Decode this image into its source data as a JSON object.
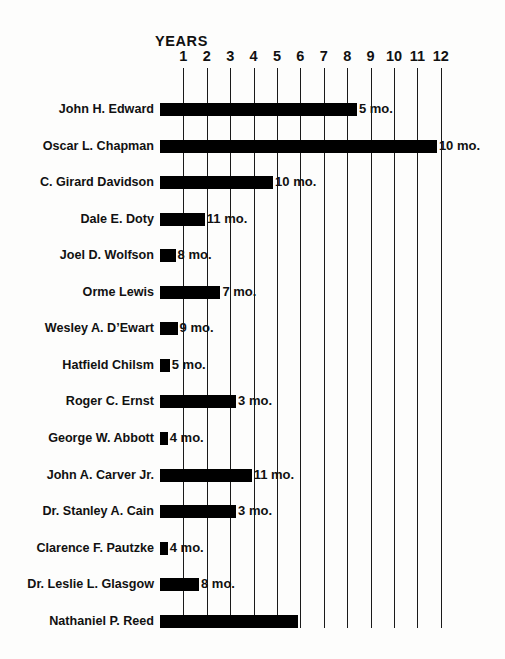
{
  "chart_data": {
    "type": "bar",
    "orientation": "horizontal",
    "title": "YEARS",
    "xlabel": "YEARS",
    "ylabel": "",
    "xlim": [
      0,
      12.2
    ],
    "grid": true,
    "legend": null,
    "xticks": [
      "1",
      "2",
      "3",
      "4",
      "5",
      "6",
      "7",
      "8",
      "9",
      "10",
      "11",
      "12"
    ],
    "xtick_values": [
      1,
      2,
      3,
      4,
      5,
      6,
      7,
      8,
      9,
      10,
      11,
      12
    ],
    "unit_note": "Bar length = years of tenure; trailing label = additional months",
    "categories": [
      "John H. Edward",
      "Oscar L. Chapman",
      "C. Girard Davidson",
      "Dale E. Doty",
      "Joel D. Wolfson",
      "Orme Lewis",
      "Wesley A. D’Ewart",
      "Hatfield Chilsm",
      "Roger C. Ernst",
      "George W. Abbott",
      "John A. Carver Jr.",
      "Dr. Stanley A. Cain",
      "Clarence F. Pautzke",
      "Dr. Leslie L. Glasgow",
      "Nathaniel P. Reed"
    ],
    "values": [
      8.417,
      11.833,
      4.833,
      1.917,
      0.667,
      2.583,
      0.75,
      0.417,
      3.25,
      0.333,
      3.917,
      3.25,
      0.333,
      1.667,
      5.917
    ],
    "annotations": [
      "5 mo.",
      "10 mo.",
      "10 mo.",
      "11 mo.",
      "8 mo.",
      "7 mo.",
      "9 mo.",
      "5 mo.",
      "3 mo.",
      "4 mo.",
      "11 mo.",
      "3 mo.",
      "4 mo.",
      "8 mo.",
      ""
    ],
    "rows": [
      {
        "name": "John H. Edward",
        "years": 8,
        "months": 5,
        "value": 8.417,
        "label": "5 mo."
      },
      {
        "name": "Oscar L. Chapman",
        "years": 11,
        "months": 10,
        "value": 11.833,
        "label": "10 mo."
      },
      {
        "name": "C. Girard Davidson",
        "years": 4,
        "months": 10,
        "value": 4.833,
        "label": "10 mo."
      },
      {
        "name": "Dale E. Doty",
        "years": 1,
        "months": 11,
        "value": 1.917,
        "label": "11 mo."
      },
      {
        "name": "Joel D. Wolfson",
        "years": 0,
        "months": 8,
        "value": 0.667,
        "label": "8 mo."
      },
      {
        "name": "Orme Lewis",
        "years": 2,
        "months": 7,
        "value": 2.583,
        "label": "7 mo."
      },
      {
        "name": "Wesley A. D’Ewart",
        "years": 0,
        "months": 9,
        "value": 0.75,
        "label": "9 mo."
      },
      {
        "name": "Hatfield Chilsm",
        "years": 0,
        "months": 5,
        "value": 0.417,
        "label": "5 mo."
      },
      {
        "name": "Roger C. Ernst",
        "years": 3,
        "months": 3,
        "value": 3.25,
        "label": "3 mo."
      },
      {
        "name": "George W. Abbott",
        "years": 0,
        "months": 4,
        "value": 0.333,
        "label": "4 mo."
      },
      {
        "name": "John A. Carver Jr.",
        "years": 3,
        "months": 11,
        "value": 3.917,
        "label": "11 mo."
      },
      {
        "name": "Dr. Stanley A. Cain",
        "years": 3,
        "months": 3,
        "value": 3.25,
        "label": "3 mo."
      },
      {
        "name": "Clarence F. Pautzke",
        "years": 0,
        "months": 4,
        "value": 0.333,
        "label": "4 mo."
      },
      {
        "name": "Dr. Leslie L. Glasgow",
        "years": 1,
        "months": 8,
        "value": 1.667,
        "label": "8 mo."
      },
      {
        "name": "Nathaniel P. Reed",
        "years": 5,
        "months": 11,
        "value": 5.917,
        "label": ""
      }
    ]
  },
  "colors": {
    "bar": "#000000",
    "gridline": "#1a1a1a",
    "text": "#111111",
    "background": "#fdfdfc"
  },
  "geometry": {
    "origin_x": 160,
    "unit_px": 23.4,
    "grid_top": 68,
    "grid_bottom": 628,
    "row_start_y": 99,
    "row_step": 36.55
  }
}
